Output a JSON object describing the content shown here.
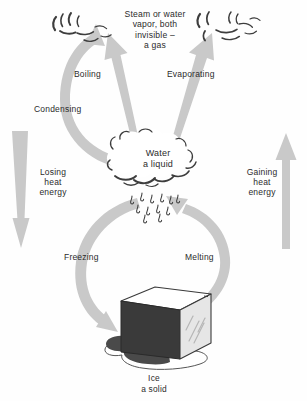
{
  "diagram": {
    "colors": {
      "arrow_gray": "#c9c9c9",
      "arrow_gray_dark": "#bdbdbd",
      "text": "#2b2b2b",
      "ice_dark_face": "#3a3a3a",
      "ice_top_face": "#ffffff",
      "ice_right_face": "#e4e4e4",
      "puddle": "#4a4a4a",
      "background": "#fefefe",
      "cloud_stroke": "#3d3d3d"
    },
    "states": {
      "gas": {
        "name": "steam-state",
        "label": "Steam or water\nvapor, both\ninvisible –\na gas"
      },
      "liquid": {
        "name": "water-state",
        "label": "Water\na liquid"
      },
      "solid": {
        "name": "ice-state",
        "label": "Ice\na solid"
      }
    },
    "processes": [
      {
        "id": "boiling",
        "label": "Boiling",
        "from": "liquid",
        "to": "gas"
      },
      {
        "id": "evaporating",
        "label": "Evaporating",
        "from": "liquid",
        "to": "gas"
      },
      {
        "id": "condensing",
        "label": "Condensing",
        "from": "gas",
        "to": "liquid"
      },
      {
        "id": "freezing",
        "label": "Freezing",
        "from": "liquid",
        "to": "solid"
      },
      {
        "id": "melting",
        "label": "Melting",
        "from": "solid",
        "to": "liquid"
      }
    ],
    "energy": {
      "losing": {
        "label": "Losing\nheat\nenergy",
        "direction": "down"
      },
      "gaining": {
        "label": "Gaining\nheat\nenergy",
        "direction": "up"
      }
    }
  }
}
